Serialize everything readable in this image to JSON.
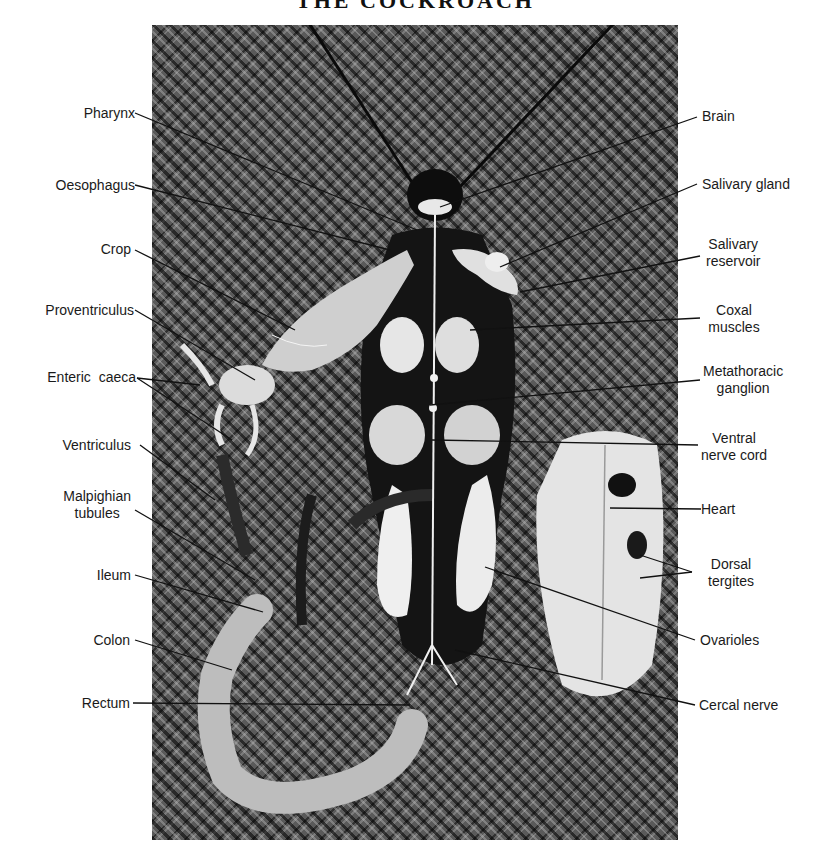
{
  "header": {
    "title": "THE COCKROACH"
  },
  "figure": {
    "labels_left": [
      {
        "id": "pharynx",
        "text": "Pharynx"
      },
      {
        "id": "oesophagus",
        "text": "Oesophagus"
      },
      {
        "id": "crop",
        "text": "Crop"
      },
      {
        "id": "proventriculus",
        "text": "Proventriculus"
      },
      {
        "id": "enteric-caeca",
        "text": "Enteric  caeca"
      },
      {
        "id": "ventriculus",
        "text": "Ventriculus"
      },
      {
        "id": "malpighian-tubules",
        "line1": "Malpighian",
        "line2": "tubules"
      },
      {
        "id": "ileum",
        "text": "Ileum"
      },
      {
        "id": "colon",
        "text": "Colon"
      },
      {
        "id": "rectum",
        "text": "Rectum"
      }
    ],
    "labels_right": [
      {
        "id": "brain",
        "text": "Brain"
      },
      {
        "id": "salivary-gland",
        "text": "Salivary gland"
      },
      {
        "id": "salivary-reservoir",
        "line1": "Salivary",
        "line2": "reservoir"
      },
      {
        "id": "coxal-muscles",
        "line1": "Coxal",
        "line2": "muscles"
      },
      {
        "id": "metathoracic-ganglion",
        "line1": "Metathoracic",
        "line2": "ganglion"
      },
      {
        "id": "ventral-nerve-cord",
        "line1": "Ventral",
        "line2": "nerve cord"
      },
      {
        "id": "heart",
        "text": "Heart"
      },
      {
        "id": "dorsal-tergites",
        "line1": "Dorsal",
        "line2": "tergites"
      },
      {
        "id": "ovarioles",
        "text": "Ovarioles"
      },
      {
        "id": "cercal-nerve",
        "text": "Cercal nerve"
      }
    ]
  }
}
